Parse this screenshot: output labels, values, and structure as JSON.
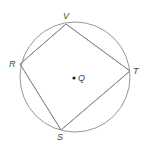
{
  "diagram": {
    "type": "geometry",
    "colors": {
      "stroke": "#8a8a8a",
      "label": "#444444",
      "center_dot": "#222222"
    },
    "circle": {
      "center_label": "Q",
      "cx": 75,
      "cy": 77,
      "r": 55
    },
    "vertices": {
      "V": {
        "label": "V",
        "x": 66,
        "y": 24
      },
      "T": {
        "label": "T",
        "x": 130,
        "y": 71
      },
      "S": {
        "label": "S",
        "x": 61,
        "y": 130
      },
      "R": {
        "label": "R",
        "x": 20,
        "y": 64
      }
    },
    "center_point": {
      "label": "Q",
      "x": 74,
      "y": 78
    }
  }
}
